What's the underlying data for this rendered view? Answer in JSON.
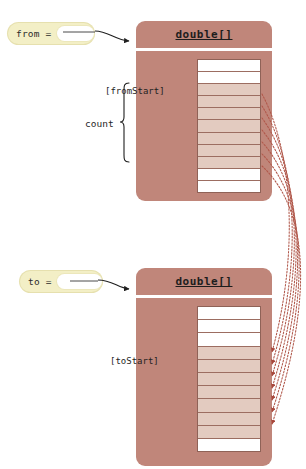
{
  "diagram": {
    "title_from": "from =",
    "title_to": "to ="
  },
  "source": {
    "pill_label": "from =",
    "type_label": "double[]",
    "index_label": "[fromStart]",
    "count_label": "count",
    "cells": [
      {
        "state": "empty"
      },
      {
        "state": "empty"
      },
      {
        "state": "filled"
      },
      {
        "state": "filled"
      },
      {
        "state": "filled"
      },
      {
        "state": "filled"
      },
      {
        "state": "filled"
      },
      {
        "state": "filled"
      },
      {
        "state": "filled"
      },
      {
        "state": "empty"
      },
      {
        "state": "empty"
      }
    ]
  },
  "destination": {
    "pill_label": "to =",
    "type_label": "double[]",
    "index_label": "[toStart]",
    "cells": [
      {
        "state": "empty"
      },
      {
        "state": "empty"
      },
      {
        "state": "empty"
      },
      {
        "state": "filled"
      },
      {
        "state": "filled"
      },
      {
        "state": "filled"
      },
      {
        "state": "filled"
      },
      {
        "state": "filled"
      },
      {
        "state": "filled"
      },
      {
        "state": "filled"
      },
      {
        "state": "empty"
      }
    ]
  },
  "colors": {
    "object_body": "#c0867a",
    "cell_filled": "#e3cbc0",
    "cell_empty": "#ffffff",
    "pill": "#f3efc6",
    "connector": "#b0574a",
    "text": "#1f1f1f"
  }
}
